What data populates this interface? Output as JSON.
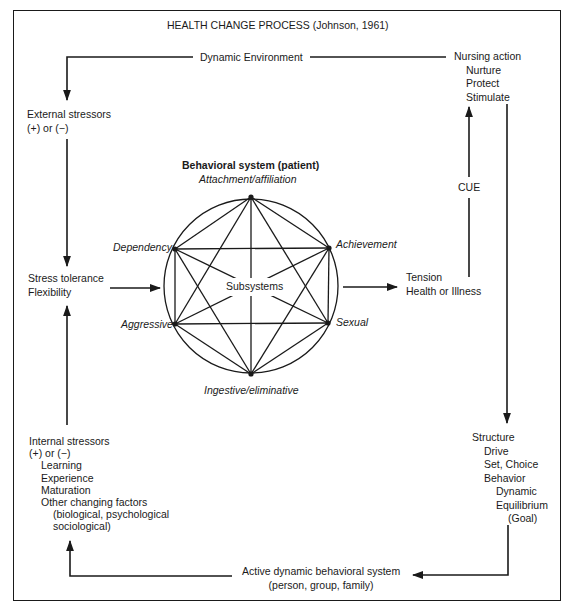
{
  "title": "HEALTH CHANGE PROCESS (Johnson, 1961)",
  "dynamic_environment": "Dynamic Environment",
  "nursing_action": {
    "heading": "Nursing action",
    "items": [
      "Nurture",
      "Protect",
      "Stimulate"
    ]
  },
  "external_stressors": {
    "line1": "External stressors",
    "line2": "(+) or (−)"
  },
  "stress_tolerance": {
    "line1": "Stress tolerance",
    "line2": "Flexibility"
  },
  "behavioral_system": {
    "heading": "Behavioral system (patient)",
    "center_label": "Subsystems",
    "subsystems": {
      "top": "Attachment/affiliation",
      "upper_left": "Dependency",
      "upper_right": "Achievement",
      "lower_left": "Aggressive",
      "lower_right": "Sexual",
      "bottom": "Ingestive/eliminative"
    }
  },
  "tension": {
    "line1": "Tension",
    "line2": "Health or Illness"
  },
  "cue": "CUE",
  "structure": {
    "lines": [
      {
        "text": "Structure",
        "indent": 0
      },
      {
        "text": "Drive",
        "indent": 1
      },
      {
        "text": "Set, Choice",
        "indent": 1
      },
      {
        "text": "Behavior",
        "indent": 1
      },
      {
        "text": "Dynamic",
        "indent": 2
      },
      {
        "text": "Equilibrium",
        "indent": 2
      },
      {
        "text": "(Goal)",
        "indent": 3
      }
    ]
  },
  "active_system": {
    "line1": "Active dynamic behavioral system",
    "line2": "(person, group, family)"
  },
  "internal_stressors": {
    "lines": [
      {
        "text": "Internal stressors",
        "indent": 0
      },
      {
        "text": "(+) or (−)",
        "indent": 0
      },
      {
        "text": "Learning",
        "indent": 1
      },
      {
        "text": "Experience",
        "indent": 1
      },
      {
        "text": "Maturation",
        "indent": 1
      },
      {
        "text": "Other changing factors",
        "indent": 1
      },
      {
        "text": "(biological, psychological",
        "indent": 2
      },
      {
        "text": "sociological)",
        "indent": 2
      }
    ]
  }
}
